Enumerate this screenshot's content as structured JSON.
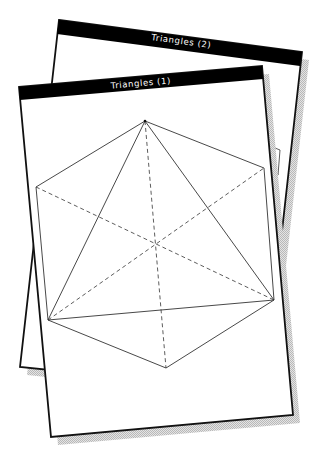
{
  "windows": [
    {
      "id": "triangles-2",
      "title": "Triangles (2)",
      "corners": {
        "tl": [
          59,
          20
        ],
        "tr": [
          302,
          52
        ],
        "br": [
          264,
          392
        ],
        "bl": [
          20,
          367
        ]
      }
    },
    {
      "id": "triangles-1",
      "title": "Triangles (1)",
      "corners": {
        "tl": [
          19,
          87
        ],
        "tr": [
          262,
          66
        ],
        "br": [
          293,
          415
        ],
        "bl": [
          51,
          437
        ]
      }
    }
  ],
  "drawing": {
    "shape": "hexagon-with-triangle",
    "vertices": {
      "top": [
        145,
        121
      ],
      "upper_right": [
        264,
        168
      ],
      "lower_right": [
        274,
        300
      ],
      "bottom": [
        166,
        368
      ],
      "lower_left": [
        48,
        320
      ],
      "upper_left": [
        36,
        187
      ]
    },
    "center": [
      155,
      244
    ],
    "solid_edges": [
      "hexagon outline",
      "top-lower_left",
      "top-lower_right",
      "lower_left-lower_right"
    ],
    "dashed_edges": [
      "top-bottom",
      "upper_left-lower_right",
      "lower_left-upper_right"
    ]
  },
  "colors": {
    "title_bar": "#000000",
    "title_text": "#ffffff",
    "window_bg": "#ffffff",
    "border": "#111111",
    "shadow": "#c8c8c8"
  }
}
